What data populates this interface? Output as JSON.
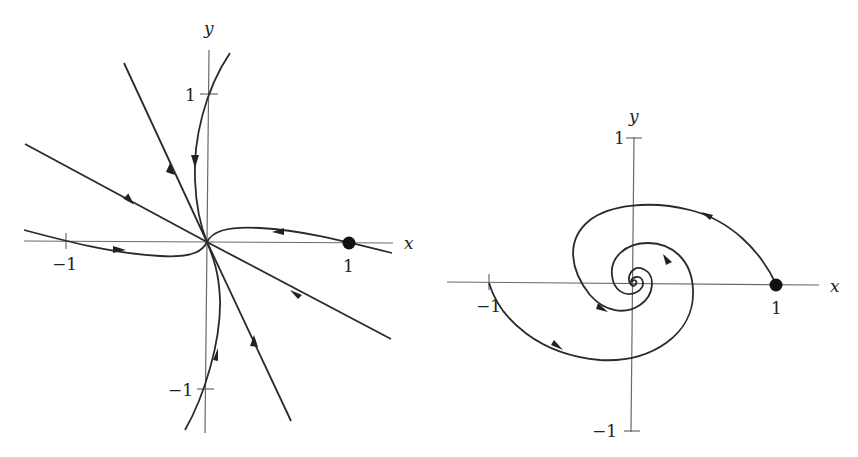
{
  "left_panel": {
    "title": "Improper/star node phase portrait",
    "axis_labels": {
      "x": "x",
      "y": "y"
    },
    "ticks": {
      "x_neg": "−1",
      "x_pos": "1",
      "y_pos": "1",
      "y_neg": "−1"
    },
    "initial_point": {
      "x": 1,
      "y": 0
    }
  },
  "right_panel": {
    "title": "Stable spiral phase portrait",
    "axis_labels": {
      "x": "x",
      "y": "y"
    },
    "ticks": {
      "x_neg": "−1",
      "x_pos": "1",
      "y_pos": "1",
      "y_neg": "−1"
    },
    "initial_point": {
      "x": 1,
      "y": 0
    }
  }
}
